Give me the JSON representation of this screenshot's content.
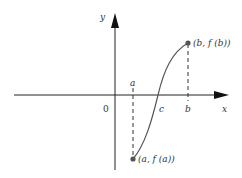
{
  "diagram": {
    "type": "intermediate value theorem graph",
    "axes": {
      "x_label": "x",
      "y_label": "y",
      "origin_label": "0"
    },
    "ticks": {
      "a": "a",
      "b": "b",
      "c": "c"
    },
    "points": {
      "start": "(a, f (a))",
      "end": "(b, f (b))"
    },
    "colors": {
      "line": "#333333",
      "curve": "#555555",
      "point": "#555555"
    }
  }
}
